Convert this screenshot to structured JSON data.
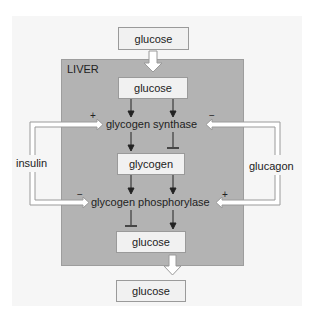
{
  "diagram": {
    "region_label": "LIVER",
    "nodes": {
      "blood_glucose_in": "glucose",
      "liver_glucose_top": "glucose",
      "glycogen_synthase": "glycogen synthase",
      "glycogen": "glycogen",
      "glycogen_phosphorylase": "glycogen phosphorylase",
      "liver_glucose_bottom": "glucose",
      "blood_glucose_out": "glucose"
    },
    "regulators": {
      "insulin": "insulin",
      "glucagon": "glucagon"
    },
    "signs": {
      "insulin_to_synthase": "+",
      "glucagon_to_synthase": "−",
      "insulin_to_phosphorylase": "−",
      "glucagon_to_phosphorylase": "+"
    },
    "colors": {
      "liver_fill": "#b3b3b3",
      "panel_fill": "#f6f6f6",
      "box_fill": "#f1f1f1",
      "arrow_outline": "#9a9a9a"
    }
  }
}
